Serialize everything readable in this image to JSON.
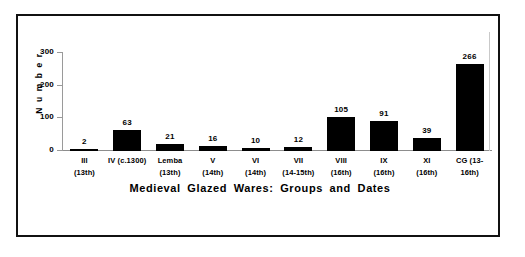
{
  "figure": {
    "frame_color": "#111111",
    "background": "#ffffff"
  },
  "chart_data": {
    "type": "bar",
    "title": "Medieval Glazed Wares: Groups and Dates",
    "xlabel": "",
    "ylabel": "Number",
    "ylim": [
      0,
      300
    ],
    "yticks": [
      0,
      100,
      200,
      300
    ],
    "grid": false,
    "legend": false,
    "bar_color": "#000000",
    "categories": [
      "III",
      "IV (c.1300)",
      "Lemba",
      "V",
      "VI",
      "VII",
      "VIII",
      "IX",
      "XI",
      "CG (13-"
    ],
    "category_dates": [
      "(13th)",
      "",
      "(13th)",
      "(14th)",
      "(14th)",
      "(14-15th)",
      "(16th)",
      "(16th)",
      "(16th)",
      "16th)"
    ],
    "values": [
      2,
      63,
      21,
      16,
      10,
      12,
      105,
      91,
      39,
      266
    ],
    "data_labels": [
      "2",
      "63",
      "21",
      "16",
      "10",
      "12",
      "105",
      "91",
      "39",
      "266"
    ]
  },
  "axis": {
    "y_tick_labels": [
      "300",
      "200",
      "100",
      "0"
    ],
    "y_title": "N u m b e r"
  }
}
